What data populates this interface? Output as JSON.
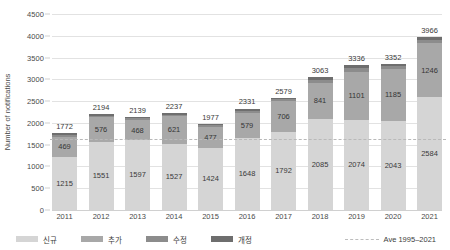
{
  "chart_data": {
    "type": "bar",
    "stacked": true,
    "title": "",
    "xlabel": "",
    "ylabel": "Number of notifications",
    "ylim": [
      0,
      4500
    ],
    "ytick_step": 500,
    "yticks": [
      "0",
      "500",
      "1000",
      "1500",
      "2000",
      "2500",
      "3000",
      "3500",
      "4000",
      "4500"
    ],
    "grid": true,
    "legend_position": "bottom",
    "categories": [
      "2011",
      "2012",
      "2013",
      "2014",
      "2015",
      "2016",
      "2017",
      "2018",
      "2019",
      "2020",
      "2021"
    ],
    "series": [
      {
        "name": "신규",
        "color": "#d5d5d5",
        "values": [
          1215,
          1551,
          1597,
          1527,
          1424,
          1648,
          1792,
          2085,
          2074,
          2043,
          2584
        ]
      },
      {
        "name": "추가",
        "color": "#a8a8a8",
        "values": [
          469,
          576,
          468,
          621,
          477,
          579,
          706,
          841,
          1101,
          1185,
          1246
        ]
      },
      {
        "name": "수정",
        "color": "#8c8c8c",
        "values": [
          40,
          37,
          38,
          45,
          40,
          50,
          43,
          70,
          90,
          72,
          85
        ]
      },
      {
        "name": "개정",
        "color": "#6e6e6e",
        "values": [
          48,
          30,
          36,
          44,
          36,
          54,
          38,
          67,
          71,
          52,
          51
        ]
      }
    ],
    "totals": [
      1772,
      2194,
      2139,
      2237,
      1977,
      2331,
      2579,
      3063,
      3336,
      3352,
      3966
    ],
    "reference_line": {
      "label": "Ave 1995–2021",
      "value": 1620,
      "style": "dashed",
      "color": "#bdbdbd"
    }
  },
  "legend": {
    "items": [
      {
        "label": "신규",
        "swatch": "sw0"
      },
      {
        "label": "추가",
        "swatch": "sw1"
      },
      {
        "label": "수정",
        "swatch": "sw2"
      },
      {
        "label": "개정",
        "swatch": "sw3"
      }
    ],
    "avg_label": "Ave 1995–2021"
  }
}
